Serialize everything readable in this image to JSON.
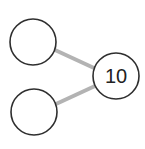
{
  "diagram": {
    "type": "number-bond",
    "whole": {
      "value": "10"
    },
    "parts": [
      {
        "value": ""
      },
      {
        "value": ""
      }
    ],
    "colors": {
      "line": "#b3b3b3",
      "circle_stroke": "#2e2e2e",
      "background": "#ffffff"
    }
  }
}
